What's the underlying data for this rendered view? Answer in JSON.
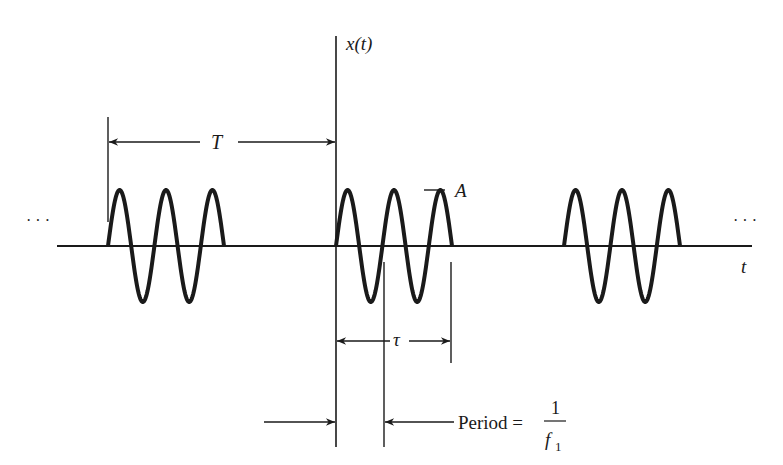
{
  "figure": {
    "type": "tone-burst waveform diagram",
    "colors": {
      "ink": "#1a1a1a",
      "background": "#ffffff"
    },
    "axes": {
      "y_label": "x(t)",
      "x_label": "t",
      "origin": {
        "x": 336,
        "y": 246
      },
      "y_top": 36,
      "x_left": 57,
      "x_right": 752
    },
    "bursts": {
      "cycles_per_burst": 2.5,
      "amplitude_px": 56,
      "width_px": 116,
      "starts_px": [
        108,
        336,
        564
      ]
    },
    "ellipsis": {
      "left": "· · ·",
      "right": "· · ·"
    },
    "labels": {
      "T": "T",
      "tau": "τ",
      "amplitude": "A",
      "period_text": "Period =",
      "fraction_numerator": "1",
      "fraction_denominator": "f",
      "fraction_subscript": "1"
    },
    "dimensions": {
      "T": {
        "x1": 108,
        "x2": 336,
        "y": 142
      },
      "tau": {
        "x1": 336,
        "x2": 451,
        "y": 341
      },
      "period": {
        "x1": 336,
        "x2": 384,
        "y": 422
      }
    }
  }
}
